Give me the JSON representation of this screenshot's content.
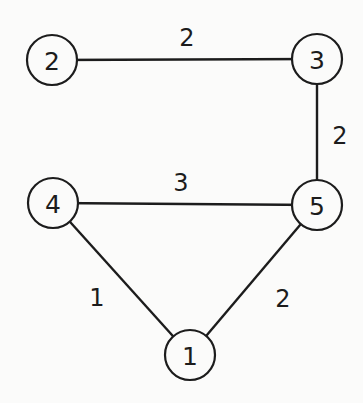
{
  "diagram": {
    "type": "weighted-undirected-graph",
    "colors": {
      "background": "#fbfbfa",
      "ink": "#1c1c1c"
    },
    "node_radius": 25,
    "nodes": [
      {
        "id": "1",
        "label": "1",
        "x": 190,
        "y": 355
      },
      {
        "id": "2",
        "label": "2",
        "x": 52,
        "y": 60
      },
      {
        "id": "3",
        "label": "3",
        "x": 317,
        "y": 59
      },
      {
        "id": "4",
        "label": "4",
        "x": 53,
        "y": 203
      },
      {
        "id": "5",
        "label": "5",
        "x": 317,
        "y": 205
      }
    ],
    "edges": [
      {
        "from": "2",
        "to": "3",
        "weight": "2",
        "label_x": 187,
        "label_y": 38
      },
      {
        "from": "3",
        "to": "5",
        "weight": "2",
        "label_x": 340,
        "label_y": 136
      },
      {
        "from": "4",
        "to": "5",
        "weight": "3",
        "label_x": 181,
        "label_y": 183
      },
      {
        "from": "4",
        "to": "1",
        "weight": "1",
        "label_x": 97,
        "label_y": 298
      },
      {
        "from": "5",
        "to": "1",
        "weight": "2",
        "label_x": 283,
        "label_y": 299
      }
    ]
  }
}
